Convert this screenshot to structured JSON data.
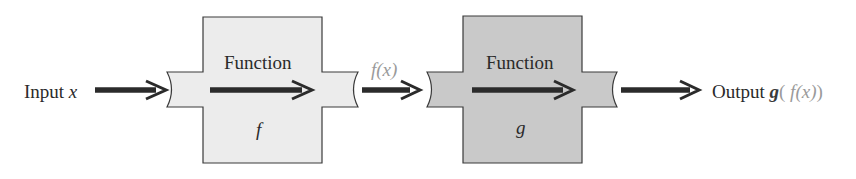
{
  "diagram": {
    "input": {
      "prefix": "Input",
      "variable": "x"
    },
    "intermediate": {
      "label": "f(x)"
    },
    "output": {
      "prefix": "Output",
      "func_outer": "g",
      "open": "(",
      "inner": " f(x)",
      "close": ")"
    },
    "boxes": [
      {
        "heading": "Function",
        "name": "f",
        "fill": "#ececec"
      },
      {
        "heading": "Function",
        "name": "g",
        "fill": "#c9c9c9"
      }
    ],
    "colors": {
      "arrow": "#2b2b2b",
      "stroke": "#3a3a3a",
      "muted_text": "#9a9a9a"
    }
  }
}
